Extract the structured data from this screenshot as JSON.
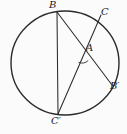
{
  "figure": {
    "background": "#fbfbfb",
    "stroke_color": "#2b2b2b",
    "label_color": "#1c1c1c",
    "circle": {
      "cx": 65,
      "cy": 63,
      "rx": 54,
      "ry": 52,
      "stroke_width": 1.4
    },
    "points": {
      "B": {
        "x": 57,
        "y": 12
      },
      "C": {
        "x": 97,
        "y": 21
      },
      "C_ext": {
        "x": 101,
        "y": 15
      },
      "Bprime": {
        "x": 112,
        "y": 85
      },
      "Cprime": {
        "x": 58,
        "y": 114
      },
      "A": {
        "x": 82,
        "y": 54
      }
    },
    "chords": [
      {
        "name": "chord-B-Cprime",
        "from": "B",
        "to": "Cprime"
      },
      {
        "name": "chord-B-Bprime",
        "from": "B",
        "to": "Bprime"
      },
      {
        "name": "chord-C-Cprime",
        "from": "C_ext",
        "to": "Cprime"
      }
    ],
    "chord_stroke_width": 1.05,
    "angle_arc": {
      "cx": 82,
      "cy": 54,
      "r": 9,
      "start_deg": 46,
      "end_deg": 113,
      "stroke_width": 0.9
    },
    "labels": [
      {
        "text": "B",
        "left": 49,
        "top": 0
      },
      {
        "text": "C",
        "left": 101,
        "top": 7
      },
      {
        "text": "A",
        "left": 86,
        "top": 43
      },
      {
        "text": "B′",
        "left": 110,
        "top": 81
      },
      {
        "text": "C′",
        "left": 51,
        "top": 116
      }
    ]
  }
}
